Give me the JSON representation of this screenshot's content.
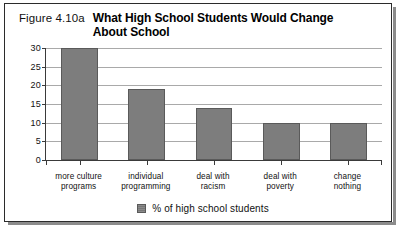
{
  "figure": {
    "number_label": "Figure 4.10a",
    "title": "What High School Students Would Change About School"
  },
  "legend": {
    "label": "% of high school students",
    "swatch_color": "#7d7d7d"
  },
  "chart_data": {
    "type": "bar",
    "title": "What High School Students Would Change About School",
    "xlabel": "",
    "ylabel": "",
    "ylim": [
      0,
      30
    ],
    "yticks": [
      0,
      5,
      10,
      15,
      20,
      25,
      30
    ],
    "ytick_labels": [
      "0",
      "5",
      "10",
      "15",
      "20",
      "25",
      "30"
    ],
    "grid": true,
    "legend_position": "bottom-center",
    "categories": [
      "more culture programs",
      "individual programming",
      "deal with racism",
      "deal with poverty",
      "change nothing"
    ],
    "category_lines": [
      [
        "more culture",
        "programs"
      ],
      [
        "individual",
        "programming"
      ],
      [
        "deal with",
        "racism"
      ],
      [
        "deal with",
        "poverty"
      ],
      [
        "change",
        "nothing"
      ]
    ],
    "series": [
      {
        "name": "% of high school students",
        "color": "#7d7d7d",
        "values": [
          30,
          19,
          14,
          10,
          10
        ]
      }
    ]
  }
}
